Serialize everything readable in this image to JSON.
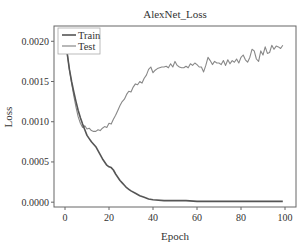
{
  "chart_data": {
    "type": "line",
    "title": "AlexNet_Loss",
    "xlabel": "Epoch",
    "ylabel": "Loss",
    "xlim": [
      -5,
      105
    ],
    "ylim": [
      -6e-05,
      0.00219
    ],
    "xticks": [
      0,
      20,
      40,
      60,
      80,
      100
    ],
    "xtick_labels": [
      "0",
      "20",
      "40",
      "60",
      "80",
      "100"
    ],
    "yticks": [
      0.0,
      0.0005,
      0.001,
      0.0015,
      0.002
    ],
    "ytick_labels": [
      "0.0000",
      "0.0005",
      "0.0010",
      "0.0015",
      "0.0020"
    ],
    "grid": false,
    "legend_position": "upper left",
    "series": [
      {
        "name": "Train",
        "color": "#555555",
        "x": [
          0,
          1,
          2,
          3,
          4,
          5,
          6,
          7,
          8,
          9,
          10,
          11,
          12,
          13,
          14,
          15,
          16,
          17,
          18,
          19,
          20,
          21,
          22,
          23,
          24,
          25,
          26,
          27,
          28,
          29,
          30,
          32,
          34,
          36,
          38,
          40,
          45,
          50,
          55,
          60,
          65,
          70,
          75,
          80,
          85,
          90,
          95,
          99
        ],
        "values": [
          0.0021,
          0.00185,
          0.00165,
          0.0015,
          0.00137,
          0.00125,
          0.00114,
          0.00105,
          0.00097,
          0.0009,
          0.00083,
          0.00079,
          0.00075,
          0.00072,
          0.00069,
          0.00064,
          0.00059,
          0.00054,
          0.0005,
          0.00046,
          0.00044,
          0.00043,
          0.0004,
          0.00035,
          0.00031,
          0.00027,
          0.00024,
          0.00021,
          0.00018,
          0.00016,
          0.00014,
          0.00011,
          8e-05,
          6e-05,
          4e-05,
          3e-05,
          2e-05,
          2e-05,
          2e-05,
          1e-05,
          1e-05,
          1e-05,
          1e-05,
          1e-05,
          1e-05,
          1e-05,
          1e-05,
          1e-05
        ]
      },
      {
        "name": "Test",
        "color": "#888888",
        "x": [
          0,
          1,
          2,
          3,
          4,
          5,
          6,
          7,
          8,
          9,
          10,
          11,
          12,
          13,
          14,
          15,
          16,
          17,
          18,
          19,
          20,
          21,
          22,
          23,
          24,
          25,
          26,
          27,
          28,
          29,
          30,
          31,
          32,
          33,
          34,
          35,
          36,
          37,
          38,
          39,
          40,
          41,
          42,
          43,
          44,
          45,
          46,
          47,
          48,
          49,
          50,
          51,
          52,
          53,
          54,
          55,
          56,
          57,
          58,
          59,
          60,
          61,
          62,
          63,
          64,
          65,
          66,
          67,
          68,
          69,
          70,
          71,
          72,
          73,
          74,
          75,
          76,
          77,
          78,
          79,
          80,
          81,
          82,
          83,
          84,
          85,
          86,
          87,
          88,
          89,
          90,
          91,
          92,
          93,
          94,
          95,
          96,
          97,
          98,
          99
        ],
        "values": [
          0.0021,
          0.00185,
          0.00165,
          0.00148,
          0.00132,
          0.00118,
          0.00106,
          0.00098,
          0.00093,
          0.00095,
          0.00091,
          0.00092,
          0.00089,
          0.00088,
          0.00088,
          0.0009,
          0.00089,
          0.00092,
          0.00094,
          0.00093,
          0.00098,
          0.00097,
          0.00103,
          0.00108,
          0.00114,
          0.0012,
          0.00125,
          0.00128,
          0.00134,
          0.00138,
          0.00137,
          0.00143,
          0.00147,
          0.00146,
          0.0015,
          0.00148,
          0.00154,
          0.00158,
          0.00165,
          0.00168,
          0.00161,
          0.00164,
          0.00166,
          0.00167,
          0.00168,
          0.00168,
          0.00169,
          0.00167,
          0.00172,
          0.00168,
          0.00175,
          0.0017,
          0.00168,
          0.00167,
          0.00167,
          0.00169,
          0.00167,
          0.00172,
          0.0017,
          0.00173,
          0.00171,
          0.00168,
          0.00168,
          0.00162,
          0.0017,
          0.0018,
          0.00176,
          0.00171,
          0.00175,
          0.00173,
          0.00173,
          0.00171,
          0.00176,
          0.0017,
          0.00177,
          0.00172,
          0.00176,
          0.00174,
          0.00178,
          0.00173,
          0.0018,
          0.00183,
          0.00177,
          0.00174,
          0.0018,
          0.0019,
          0.00188,
          0.00178,
          0.00175,
          0.00188,
          0.00183,
          0.00193,
          0.00185,
          0.00186,
          0.00195,
          0.0019,
          0.00194,
          0.00193,
          0.00191,
          0.00195
        ]
      }
    ]
  },
  "legend": {
    "items": [
      {
        "label": "Train",
        "color": "#555555"
      },
      {
        "label": "Test",
        "color": "#888888"
      }
    ]
  }
}
